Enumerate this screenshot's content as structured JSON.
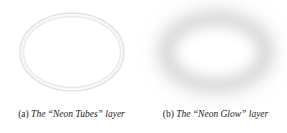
{
  "figure": {
    "background_color": "#ffffff",
    "width": 287,
    "height": 133
  },
  "panels": [
    {
      "id": "neon-tubes",
      "label": "(a)",
      "caption": "The “Neon Tubes” layer",
      "artwork": {
        "shape": "ellipse-outline",
        "description": "thin double-stroke ellipse outline resembling a neon tube",
        "stroke_color": "#e2e2e2",
        "stroke_color_inner": "#ececec",
        "stroke_width_px": 1.4,
        "tube_gap_px": 3.5
      }
    },
    {
      "id": "neon-glow",
      "label": "(b)",
      "caption": "The “Neon Glow” layer",
      "artwork": {
        "shape": "ellipse-glow",
        "description": "soft blurred gray ring representing the glow around the tube",
        "glow_color": "#c9c9c9",
        "glow_color_outer": "#dcdcdc",
        "blur_px": 7
      }
    }
  ]
}
